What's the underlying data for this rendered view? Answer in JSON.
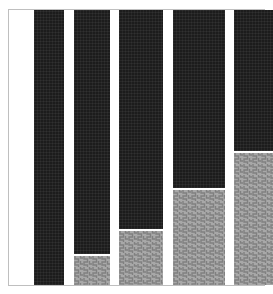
{
  "figure": {
    "background_color": "#ffffff",
    "frame_color": "#bfbfbf",
    "width": 273,
    "height": 294
  },
  "colors": {
    "dark_segment": "#1c1c1c",
    "light_segment": "#a8a8a8",
    "light_segment_hatch": "#8a8a8a",
    "separator": "#ffffff"
  },
  "chart_data": {
    "type": "bar",
    "title": "",
    "subtitle": "",
    "xlabel": "",
    "ylabel": "",
    "xlim": [
      0,
      100
    ],
    "ylim": [
      0,
      100
    ],
    "grid": false,
    "legend": null,
    "stacked": true,
    "orientation": "vertical",
    "categories": [
      "1",
      "2",
      "3",
      "4",
      "5"
    ],
    "tick_labels": [],
    "annotations": [],
    "series": [
      {
        "name": "dark",
        "fill": "#1c1c1c",
        "hatch": "dense-cross",
        "values": [
          100,
          89.5,
          80.5,
          65.5,
          52.0
        ]
      },
      {
        "name": "light",
        "fill": "#a8a8a8",
        "hatch": "zigzag",
        "values": [
          0,
          10.5,
          19.5,
          34.5,
          48.0
        ]
      }
    ],
    "bars": [
      {
        "index": 0,
        "category": "1",
        "x_left_pct": 9.8,
        "width_pct": 11.8,
        "dark_pct": 100.0,
        "light_pct": 0.0
      },
      {
        "index": 1,
        "category": "2",
        "x_left_pct": 25.3,
        "width_pct": 14.4,
        "dark_pct": 89.5,
        "light_pct": 10.5
      },
      {
        "index": 2,
        "category": "3",
        "x_left_pct": 43.3,
        "width_pct": 17.1,
        "dark_pct": 80.5,
        "light_pct": 19.5
      },
      {
        "index": 3,
        "category": "4",
        "x_left_pct": 64.2,
        "width_pct": 20.6,
        "dark_pct": 65.5,
        "light_pct": 34.5
      },
      {
        "index": 4,
        "category": "5",
        "x_left_pct": 88.4,
        "width_pct": 25.4,
        "dark_pct": 52.0,
        "light_pct": 48.0
      }
    ]
  }
}
